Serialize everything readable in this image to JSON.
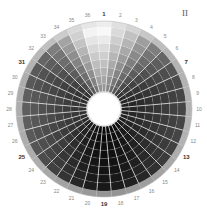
{
  "plate_label": "II",
  "chart_data": {
    "type": "polar-wheel",
    "title": "",
    "segments": 36,
    "labels": [
      "1",
      "2",
      "3",
      "4",
      "5",
      "6",
      "7",
      "8",
      "9",
      "10",
      "11",
      "12",
      "13",
      "14",
      "15",
      "16",
      "17",
      "18",
      "19",
      "20",
      "21",
      "22",
      "23",
      "24",
      "25",
      "26",
      "27",
      "28",
      "29",
      "30",
      "31",
      "32",
      "33",
      "34",
      "35",
      "36"
    ],
    "major_labels": [
      "1",
      "7",
      "13",
      "19",
      "25",
      "31"
    ],
    "direction": "clockwise from top",
    "rings": 8,
    "outer_ring_lightness": [
      0.93,
      0.88,
      0.83,
      0.78,
      0.74,
      0.72,
      0.7,
      0.7,
      0.7,
      0.7,
      0.7,
      0.7,
      0.68,
      0.66,
      0.64,
      0.62,
      0.6,
      0.58,
      0.58,
      0.6,
      0.62,
      0.64,
      0.66,
      0.68,
      0.68,
      0.68,
      0.68,
      0.68,
      0.68,
      0.68,
      0.7,
      0.72,
      0.75,
      0.8,
      0.85,
      0.9
    ],
    "segment_lightness": [
      0.97,
      0.85,
      0.72,
      0.58,
      0.45,
      0.35,
      0.28,
      0.24,
      0.22,
      0.22,
      0.22,
      0.22,
      0.2,
      0.18,
      0.14,
      0.1,
      0.07,
      0.05,
      0.04,
      0.06,
      0.1,
      0.15,
      0.2,
      0.25,
      0.28,
      0.3,
      0.32,
      0.32,
      0.32,
      0.3,
      0.3,
      0.35,
      0.45,
      0.6,
      0.78,
      0.95
    ],
    "center": [
      104,
      109
    ],
    "outer_radius": 88,
    "inner_radius": 17
  }
}
